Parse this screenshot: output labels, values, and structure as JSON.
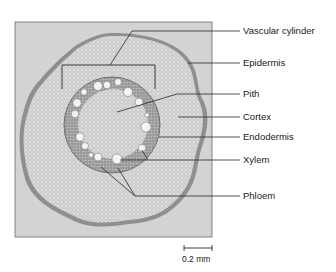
{
  "figure": {
    "type": "micrograph cross-section",
    "colors": {
      "background": "#ffffff",
      "micrograph_bg": "#cfcfcf",
      "tissue_outer": "#bdbdbd",
      "tissue_inner": "#d9d9d9",
      "endodermis_ring": "#8c8c8c",
      "vessel": "#f2f2f2",
      "leader_line": "#2a2a2a"
    }
  },
  "labels": [
    {
      "id": "vascular-cylinder",
      "text": "Vascular cylinder"
    },
    {
      "id": "epidermis",
      "text": "Epidermis"
    },
    {
      "id": "pith",
      "text": "Pith"
    },
    {
      "id": "cortex",
      "text": "Cortex"
    },
    {
      "id": "endodermis",
      "text": "Endodermis"
    },
    {
      "id": "xylem",
      "text": "Xylem"
    },
    {
      "id": "phloem",
      "text": "Phloem"
    }
  ],
  "scale_bar": {
    "label": "0.2 mm"
  }
}
